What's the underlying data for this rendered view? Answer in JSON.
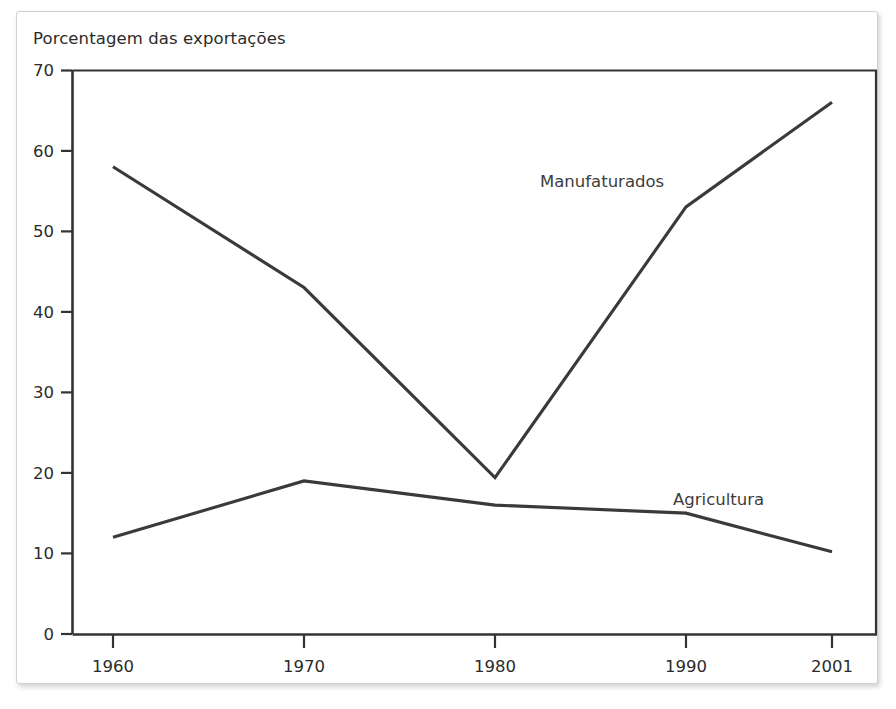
{
  "figure": {
    "title": "Porcentagem das exportações",
    "frame_color": "#d2d0ce",
    "background": "#ffffff"
  },
  "chart_data": {
    "type": "line",
    "title": "Porcentagem das exportações",
    "xlabel": "",
    "ylabel": "Porcentagem das exportações",
    "categories": [
      "1960",
      "1970",
      "1980",
      "1990",
      "2001"
    ],
    "x": [
      1960,
      1970,
      1980,
      1990,
      2001
    ],
    "series": [
      {
        "name": "Manufaturados",
        "values": [
          58,
          43,
          19.4,
          53,
          66
        ],
        "color": "#3a3a3a",
        "label_x": 1985,
        "label_y": 55.5
      },
      {
        "name": "Agricultura",
        "values": [
          12,
          19,
          16,
          15,
          10.2
        ],
        "color": "#3a3a3a",
        "label_x": 1994,
        "label_y": 18.5
      }
    ],
    "ylim": [
      0,
      70
    ],
    "yticks": [
      0,
      10,
      20,
      30,
      40,
      50,
      60,
      70
    ],
    "ytick_labels": [
      "0",
      "10",
      "20",
      "30",
      "40",
      "50",
      "60",
      "70"
    ],
    "xtick_labels": [
      "1960",
      "1970",
      "1980",
      "1990",
      "2001"
    ],
    "grid": false,
    "legend": "inline-annotation",
    "line_color": "#3a3a3a",
    "axis_color": "#333333"
  },
  "axis": {
    "y_ticks": [
      {
        "label": "70"
      },
      {
        "label": "60"
      },
      {
        "label": "50"
      },
      {
        "label": "40"
      },
      {
        "label": "30"
      },
      {
        "label": "20"
      },
      {
        "label": "10"
      },
      {
        "label": "0"
      }
    ],
    "x_ticks": [
      {
        "label": "1960"
      },
      {
        "label": "1970"
      },
      {
        "label": "1980"
      },
      {
        "label": "1990"
      },
      {
        "label": "2001"
      }
    ]
  },
  "annotations": {
    "manufaturados": "Manufaturados",
    "agricultura": "Agricultura"
  }
}
